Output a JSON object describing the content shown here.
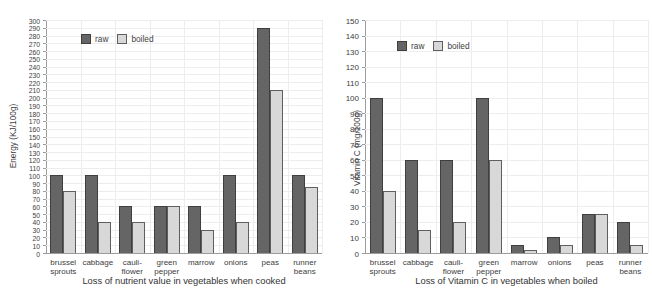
{
  "figure": {
    "background": "#ffffff",
    "legend": {
      "raw_label": "raw",
      "boiled_label": "boiled",
      "position": "top-left-inside"
    }
  },
  "colors": {
    "raw_fill": "#656565",
    "raw_border": "#3f3f3f",
    "boiled_fill": "#d8d8d8",
    "boiled_border": "#5f5f5f",
    "grid": "#ededed",
    "axis": "#9c9c9c",
    "text": "#3d3d3d"
  },
  "chart_data": [
    {
      "type": "bar",
      "title": "Loss of nutrient value in vegetables when cooked",
      "ylabel": "Energy (KJ/100g)",
      "xlabel": "",
      "ylim": [
        0,
        300
      ],
      "ytick_step": 10,
      "grid": true,
      "legend_entries": [
        "raw",
        "boiled"
      ],
      "categories": [
        "brussel sprouts",
        "cabbage",
        "cauli-flower",
        "green pepper",
        "marrow",
        "onions",
        "peas",
        "runner beans"
      ],
      "category_label_lines": [
        [
          "brussel",
          "sprouts"
        ],
        [
          "cabbage"
        ],
        [
          "cauli-",
          "flower"
        ],
        [
          "green",
          "pepper"
        ],
        [
          "marrow"
        ],
        [
          "onions"
        ],
        [
          "peas"
        ],
        [
          "runner",
          "beans"
        ]
      ],
      "series": [
        {
          "name": "raw",
          "values": [
            100,
            100,
            60,
            60,
            60,
            100,
            290,
            100
          ]
        },
        {
          "name": "boiled",
          "values": [
            80,
            40,
            40,
            60,
            30,
            40,
            210,
            85
          ]
        }
      ]
    },
    {
      "type": "bar",
      "title": "Loss of Vitamin C in vegetables when boiled",
      "ylabel": "Vitamin C (mg/100g)",
      "xlabel": "",
      "ylim": [
        0,
        150
      ],
      "ytick_step": 10,
      "grid": true,
      "legend_entries": [
        "raw",
        "boiled"
      ],
      "categories": [
        "brussel sprouts",
        "cabbage",
        "cauli-flower",
        "green pepper",
        "marrow",
        "onions",
        "peas",
        "runner beans"
      ],
      "category_label_lines": [
        [
          "brussel",
          "sprouts"
        ],
        [
          "cabbage"
        ],
        [
          "cauli-",
          "flower"
        ],
        [
          "green",
          "pepper"
        ],
        [
          "marrow"
        ],
        [
          "onions"
        ],
        [
          "peas"
        ],
        [
          "runner",
          "beans"
        ]
      ],
      "series": [
        {
          "name": "raw",
          "values": [
            100,
            60,
            60,
            100,
            5,
            10,
            25,
            20
          ]
        },
        {
          "name": "boiled",
          "values": [
            40,
            15,
            20,
            60,
            2,
            5,
            25,
            5
          ]
        }
      ]
    }
  ]
}
